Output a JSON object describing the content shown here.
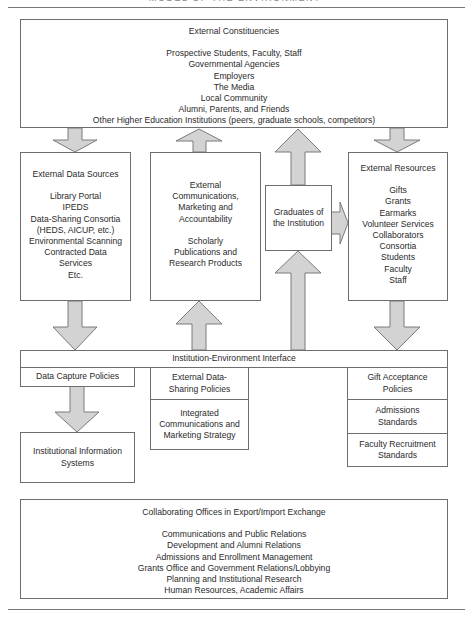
{
  "figure": {
    "clipped_title": "MODEL OF THE ENVIRONMENT",
    "colors": {
      "arrow_fill": "#d3d3d3",
      "arrow_stroke": "#7a7a7a",
      "box_border": "#6e6e6e",
      "text": "#2a2a2a"
    }
  },
  "external_constituencies": {
    "title": "External Constituencies",
    "items": [
      "Prospective Students, Faculty, Staff",
      "Governmental Agencies",
      "Employers",
      "The Media",
      "Local Community",
      "Alumni, Parents, and Friends",
      "Other Higher Education Institutions (peers, graduate schools, competitors)"
    ]
  },
  "external_data_sources": {
    "title": "External Data Sources",
    "items": [
      "Library Portal",
      "IPEDS",
      "Data-Sharing Consortia",
      "(HEDS, AICUP, etc.)",
      "Environmental Scanning",
      "Contracted Data",
      "Services",
      "Etc."
    ]
  },
  "external_communications": {
    "lines_a": [
      "External",
      "Communications,",
      "Marketing and",
      "Accountability"
    ],
    "lines_b": [
      "Scholarly",
      "Publications and",
      "Research Products"
    ]
  },
  "graduates": {
    "lines": [
      "Graduates of",
      "the Institution"
    ]
  },
  "external_resources": {
    "title": "External Resources",
    "items": [
      "Gifts",
      "Grants",
      "Earmarks",
      "Volunteer Services",
      "Collaborators",
      "Consortia",
      "Students",
      "Faculty",
      "Staff"
    ]
  },
  "interface": {
    "title": "Institution-Environment Interface",
    "data_capture_policies": "Data Capture  Policies",
    "institutional_information_systems": [
      "Institutional Information",
      "Systems"
    ],
    "external_data_sharing_policies": [
      "External Data-",
      "Sharing Policies"
    ],
    "integrated_communications": [
      "Integrated",
      "Communications and",
      "Marketing Strategy"
    ],
    "gift_acceptance_policies": [
      "Gift Acceptance",
      "Policies"
    ],
    "admissions_standards": [
      "Admissions",
      "Standards"
    ],
    "faculty_recruitment_standards": [
      "Faculty Recruitment",
      "Standards"
    ]
  },
  "collaborating_offices": {
    "title": "Collaborating Offices in Export/Import Exchange",
    "items": [
      "Communications and Public Relations",
      "Development and Alumni Relations",
      "Admissions and Enrollment Management",
      "Grants Office and Government Relations/Lobbying",
      "Planning and Institutional Research",
      "Human Resources, Academic Affairs"
    ]
  }
}
